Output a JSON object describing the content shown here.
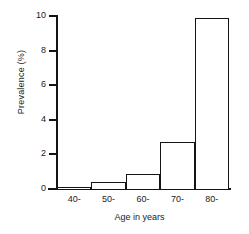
{
  "chart_data": {
    "type": "bar",
    "title": "",
    "subtitle": "",
    "xlabel": "Age in years",
    "ylabel": "Prevalence (%)",
    "categories": [
      "40-",
      "50-",
      "60-",
      "70-",
      "80-"
    ],
    "values": [
      0.1,
      0.4,
      0.85,
      2.7,
      9.9
    ],
    "series": [
      {
        "name": "Prevalence",
        "values": [
          0.1,
          0.4,
          0.85,
          2.7,
          9.9
        ]
      }
    ],
    "xlim": [
      35,
      85
    ],
    "ylim": [
      0,
      10
    ],
    "yticks": [
      0,
      2,
      4,
      6,
      8,
      10
    ],
    "ytick_labels": [
      "0",
      "2",
      "4",
      "6",
      "8",
      "10"
    ],
    "xtick_labels": [
      "40-",
      "50-",
      "60-",
      "70-",
      "80-"
    ],
    "grid": false,
    "legend": false,
    "legend_position": "none",
    "bar_fill_color": "#ffffff",
    "bar_edge_color": "#141414",
    "axis_color": "#141414",
    "background_color": "#ffffff",
    "text_color": "#1a1a1a"
  }
}
